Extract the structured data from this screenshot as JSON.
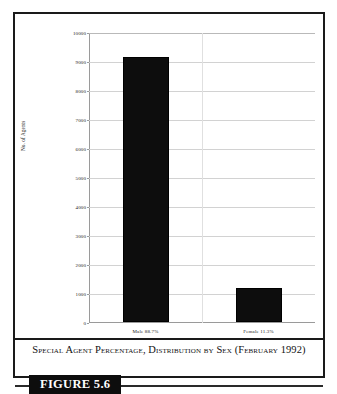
{
  "figure": {
    "caption": "Special Agent Percentage, Distribution by Sex (February 1992)",
    "label": "FIGURE 5.6"
  },
  "chart_data": {
    "type": "bar",
    "title": "",
    "categories": [
      "Male  88.7%",
      "Female  11.3%"
    ],
    "values": [
      9150,
      1166
    ],
    "series": [
      {
        "name": "No. of Agents",
        "values": [
          9150,
          1166
        ]
      }
    ],
    "xlabel": "",
    "ylabel": "No. of Agents",
    "ylim": [
      0,
      10000
    ],
    "yticks": [
      0,
      1000,
      2000,
      3000,
      4000,
      5000,
      6000,
      7000,
      8000,
      9000,
      10000
    ],
    "ytick_labels": [
      "0",
      "1000",
      "2000",
      "3000",
      "4000",
      "5000",
      "6000",
      "7000",
      "8000",
      "9000",
      "10000"
    ],
    "grid": true,
    "legend": false,
    "bar_color": "#0d0d0d",
    "percentages": [
      "88.7%",
      "11.3%"
    ]
  }
}
